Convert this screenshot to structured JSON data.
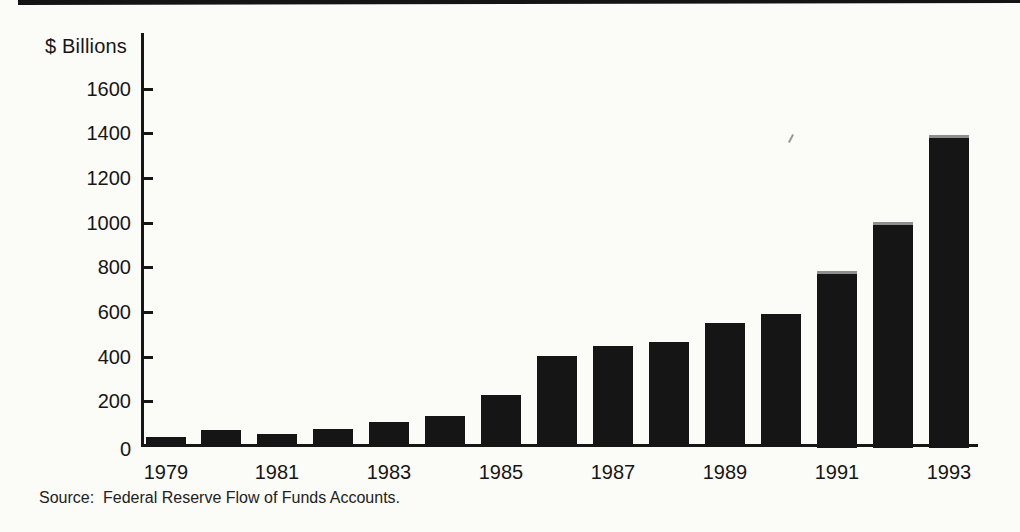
{
  "chart_data": {
    "type": "bar",
    "title": "",
    "xlabel": "",
    "ylabel": "$ Billions",
    "categories": [
      1979,
      1980,
      1981,
      1982,
      1983,
      1984,
      1985,
      1986,
      1987,
      1988,
      1989,
      1990,
      1991,
      1992,
      1993
    ],
    "values": [
      35,
      65,
      50,
      70,
      105,
      130,
      225,
      400,
      445,
      460,
      545,
      585,
      780,
      1000,
      1390
    ],
    "x_tick_labels": [
      "1979",
      "1981",
      "1983",
      "1985",
      "1987",
      "1989",
      "1991",
      "1993"
    ],
    "y_ticks": [
      0,
      200,
      400,
      600,
      800,
      1000,
      1200,
      1400,
      1600
    ],
    "ylim": [
      0,
      1850
    ],
    "grid": false,
    "legend": null,
    "bar_color": "#151515",
    "axis_color": "#161616"
  },
  "source_note": "Source:  Federal Reserve Flow of Funds Accounts."
}
